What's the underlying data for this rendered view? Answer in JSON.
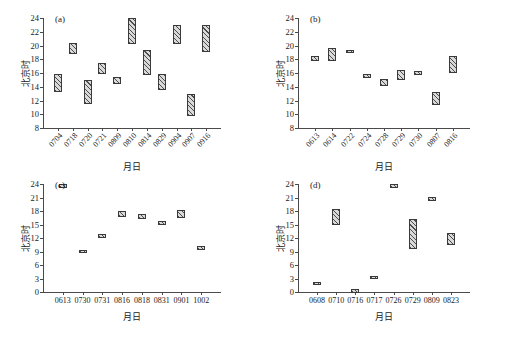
{
  "figure": {
    "axis_titles": {
      "y": "北京时",
      "x": "月日"
    },
    "bar_style": {
      "fill": "#b9b9b9",
      "hatch": "#4d4d4d",
      "border": "#3a3a3a"
    },
    "axis_color": "#4a4a4a"
  },
  "chart_data": [
    {
      "type": "bar",
      "panel": "(a)",
      "title": "",
      "xlabel": "月日",
      "ylabel": "北京时",
      "ylim": [
        8,
        24
      ],
      "yticks": [
        8,
        10,
        12,
        14,
        16,
        18,
        20,
        22,
        24
      ],
      "grid": false,
      "legend": "none",
      "xtick_rotation": -48,
      "categories": [
        "0704",
        "0718",
        "0720",
        "0721",
        "0809",
        "0810",
        "0814",
        "0829",
        "0904",
        "0907",
        "0916"
      ],
      "ranges": [
        [
          13.3,
          15.8
        ],
        [
          18.8,
          20.3
        ],
        [
          11.5,
          15.0
        ],
        [
          15.8,
          17.4
        ],
        [
          14.4,
          15.4
        ],
        [
          20.2,
          24.0
        ],
        [
          15.7,
          19.4
        ],
        [
          13.5,
          15.9
        ],
        [
          20.2,
          23.0
        ],
        [
          9.7,
          13.0
        ],
        [
          19.0,
          23.0
        ]
      ]
    },
    {
      "type": "bar",
      "panel": "(b)",
      "title": "",
      "xlabel": "月日",
      "ylabel": "北京时",
      "ylim": [
        8,
        24
      ],
      "yticks": [
        8,
        10,
        12,
        14,
        16,
        18,
        20,
        22,
        24
      ],
      "grid": false,
      "legend": "none",
      "xtick_rotation": -48,
      "categories": [
        "0613",
        "0614",
        "0722",
        "0724",
        "0728",
        "0729",
        "0730",
        "0807",
        "0816"
      ],
      "ranges": [
        [
          17.7,
          18.5
        ],
        [
          17.7,
          19.7
        ],
        [
          18.9,
          19.4
        ],
        [
          15.3,
          15.9
        ],
        [
          14.1,
          15.2
        ],
        [
          15.0,
          16.4
        ],
        [
          15.7,
          16.3
        ],
        [
          11.3,
          13.2
        ],
        [
          16.0,
          18.5
        ]
      ]
    },
    {
      "type": "bar",
      "panel": "(c)",
      "title": "",
      "xlabel": "月日",
      "ylabel": "北京时",
      "ylim": [
        0,
        24
      ],
      "yticks": [
        0,
        3,
        6,
        9,
        12,
        15,
        18,
        21,
        24
      ],
      "grid": false,
      "legend": "none",
      "xtick_rotation": 0,
      "categories": [
        "0613",
        "0730",
        "0731",
        "0816",
        "0818",
        "0831",
        "0901",
        "1002"
      ],
      "ranges": [
        [
          23.4,
          24.0
        ],
        [
          8.7,
          9.4
        ],
        [
          12.1,
          12.9
        ],
        [
          16.7,
          18.0
        ],
        [
          16.3,
          17.3
        ],
        [
          15.2,
          15.7
        ],
        [
          16.5,
          18.2
        ],
        [
          9.5,
          10.2
        ]
      ]
    },
    {
      "type": "bar",
      "panel": "(d)",
      "title": "",
      "xlabel": "月日",
      "ylabel": "北京时",
      "ylim": [
        0,
        24
      ],
      "yticks": [
        0,
        3,
        6,
        9,
        12,
        15,
        18,
        21,
        24
      ],
      "grid": false,
      "legend": "none",
      "xtick_rotation": 0,
      "categories": [
        "0608",
        "0710",
        "0716",
        "0717",
        "0726",
        "0729",
        "0809",
        "0823"
      ],
      "ranges": [
        [
          1.6,
          2.3
        ],
        [
          14.8,
          18.4
        ],
        [
          0.0,
          0.6
        ],
        [
          2.9,
          3.6
        ],
        [
          23.6,
          24.0
        ],
        [
          9.5,
          16.2
        ],
        [
          20.2,
          21.2
        ],
        [
          10.5,
          13.1
        ]
      ]
    }
  ]
}
